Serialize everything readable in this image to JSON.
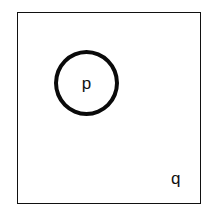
{
  "diagram": {
    "type": "euler-diagram",
    "title": "",
    "background_color": "#ffffff",
    "stroke_color": "#111111",
    "universe": {
      "shape": "rectangle",
      "label": "q",
      "label_position": "bottom-right-inside",
      "border_width_px": 1.6,
      "x": 17,
      "y": 12,
      "width": 184,
      "height": 192
    },
    "sets": [
      {
        "shape": "circle",
        "label": "p",
        "label_position": "center",
        "border_width_px": 4,
        "fill": "#ffffff",
        "x": 54,
        "y": 50,
        "width": 65,
        "height": 66
      }
    ],
    "labels": {
      "inner": "p",
      "outer": "q"
    }
  }
}
